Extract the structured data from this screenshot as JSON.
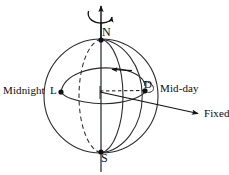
{
  "figure": {
    "background_color": "#ffffff",
    "line_color": "#111111"
  },
  "labels": {
    "north_pole": "N",
    "south_pole": "S",
    "local_point": "L",
    "midday_point": "D",
    "midnight": "Midnight",
    "midday": "Mid-day",
    "fixed": "Fixed"
  },
  "geometry": {
    "sphere": {
      "cx": 101,
      "cy": 96,
      "r": 57
    },
    "axis": {
      "x": 101,
      "top_y": 2,
      "bottom_y": 172
    },
    "north_pole_point": {
      "x": 101,
      "y": 40
    },
    "south_pole_point": {
      "x": 101,
      "y": 152
    },
    "local_point": {
      "x": 61,
      "y": 92
    },
    "midday_point": {
      "x": 145,
      "y": 91
    },
    "center_point": {
      "x": 101,
      "y": 91
    },
    "rotation_arrow": {
      "cx": 101,
      "cy": 12,
      "rx": 14,
      "ry": 7,
      "direction": "clockwise-from-above"
    },
    "latitude_circle_arrow": {
      "x": 118,
      "y": 70,
      "direction": "left"
    },
    "fixed_arrow_tip": {
      "x": 200,
      "y": 114
    }
  },
  "elements": [
    {
      "name": "sphere-outline",
      "kind": "circle",
      "style": "solid"
    },
    {
      "name": "meridian-ellipse-front",
      "kind": "ellipse-arc",
      "style": "solid"
    },
    {
      "name": "meridian-ellipse-back",
      "kind": "ellipse-arc",
      "style": "dashed"
    },
    {
      "name": "latitude-circle",
      "kind": "ellipse",
      "style": "solid"
    },
    {
      "name": "equatorial-radius",
      "kind": "line",
      "style": "dashed"
    },
    {
      "name": "fixed-direction-ray",
      "kind": "arrow",
      "style": "solid"
    },
    {
      "name": "rotation-axis",
      "kind": "arrow",
      "style": "solid"
    },
    {
      "name": "rotation-indicator",
      "kind": "curved-arrow",
      "style": "solid"
    }
  ]
}
